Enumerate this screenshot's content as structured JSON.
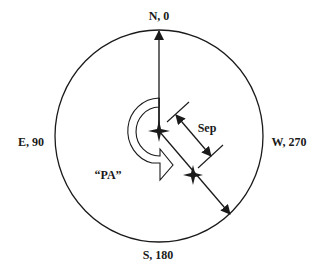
{
  "diagram": {
    "colors": {
      "stroke": "#1a1a1a",
      "background": "#ffffff"
    },
    "compass_labels": {
      "north": "N, 0",
      "east": "E, 90",
      "south": "S, 180",
      "west": "W, 270"
    },
    "annotations": {
      "position_angle": "“PA”",
      "separation": "Sep"
    },
    "elements": [
      {
        "name": "sky-circle",
        "type": "circle"
      },
      {
        "name": "north-arrow",
        "type": "arrow",
        "direction": "up"
      },
      {
        "name": "primary-star",
        "type": "star-marker"
      },
      {
        "name": "secondary-star",
        "type": "star-marker"
      },
      {
        "name": "pa-curved-arrow",
        "type": "curved-arrow",
        "direction": "counterclockwise"
      },
      {
        "name": "separation-dimension",
        "type": "dimension-arrow"
      },
      {
        "name": "direction-arrow",
        "type": "arrow",
        "direction": "down-right"
      }
    ]
  }
}
